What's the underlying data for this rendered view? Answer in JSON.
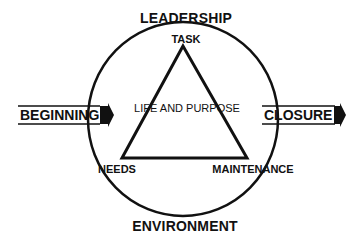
{
  "diagram": {
    "top_label": "LEADERSHIP",
    "bottom_label": "ENVIRONMENT",
    "left_arrow_label": "BEGINNING",
    "right_arrow_label": "CLOSURE",
    "center_label": "LIFE AND PURPOSE",
    "vertices": {
      "top": "TASK",
      "bottom_left": "NEEDS",
      "bottom_right": "MAINTENANCE"
    }
  }
}
